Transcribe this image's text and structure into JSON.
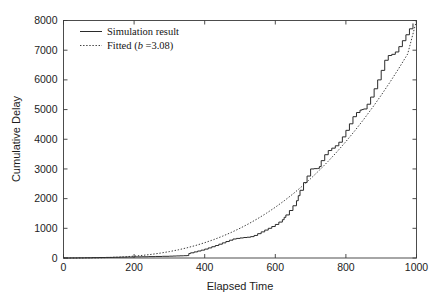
{
  "chart_data": {
    "type": "line",
    "title": "",
    "xlabel": "Elapsed Time",
    "ylabel": "Cumulative Delay",
    "xlim": [
      0,
      1000
    ],
    "ylim": [
      0,
      8000
    ],
    "xticks": [
      0,
      200,
      400,
      600,
      800,
      1000
    ],
    "yticks": [
      0,
      1000,
      2000,
      3000,
      4000,
      5000,
      6000,
      7000,
      8000
    ],
    "xtick_labels": [
      "0",
      "200",
      "400",
      "600",
      "800",
      "1000"
    ],
    "ytick_labels": [
      "0",
      "1000",
      "2000",
      "3000",
      "4000",
      "5000",
      "6000",
      "7000",
      "8000"
    ],
    "grid": false,
    "legend_position": "upper-left-inside",
    "legend_frame": false,
    "series": [
      {
        "name": "Simulation result",
        "label": "Simulation result",
        "style": "solid",
        "color": "#2b2b2b",
        "shape": "step",
        "x": [
          0,
          20,
          40,
          60,
          80,
          100,
          120,
          140,
          160,
          180,
          200,
          220,
          240,
          260,
          280,
          300,
          310,
          320,
          330,
          340,
          350,
          355,
          360,
          370,
          380,
          390,
          400,
          410,
          420,
          430,
          440,
          450,
          460,
          470,
          480,
          490,
          500,
          510,
          520,
          530,
          540,
          550,
          560,
          570,
          580,
          590,
          600,
          610,
          620,
          625,
          630,
          640,
          650,
          660,
          665,
          670,
          680,
          690,
          700,
          710,
          720,
          725,
          730,
          740,
          750,
          760,
          770,
          780,
          790,
          800,
          810,
          820,
          830,
          840,
          845,
          850,
          860,
          870,
          880,
          890,
          900,
          910,
          920,
          930,
          940,
          950,
          960,
          970,
          980,
          990
        ],
        "y": [
          0,
          2,
          5,
          8,
          12,
          16,
          20,
          24,
          28,
          33,
          38,
          42,
          47,
          52,
          57,
          62,
          66,
          70,
          74,
          78,
          82,
          150,
          175,
          205,
          235,
          265,
          300,
          340,
          380,
          420,
          465,
          510,
          555,
          600,
          640,
          660,
          675,
          690,
          700,
          720,
          760,
          820,
          880,
          940,
          1000,
          1060,
          1130,
          1210,
          1290,
          1370,
          1450,
          1600,
          1760,
          1930,
          2100,
          2280,
          2540,
          2760,
          3000,
          3010,
          3020,
          3080,
          3280,
          3480,
          3620,
          3700,
          3780,
          3900,
          4080,
          4300,
          4520,
          4760,
          4900,
          4980,
          5000,
          5020,
          5180,
          5420,
          5700,
          6000,
          6320,
          6660,
          6820,
          6860,
          6940,
          7120,
          7320,
          7520,
          7720,
          7900
        ]
      },
      {
        "name": "Fitted (b =3.08)",
        "label_prefix": "Fitted (",
        "label_param": "b",
        "label_suffix": " =3.08)",
        "style": "dotted",
        "color": "#3c3c3c",
        "shape": "smooth",
        "model": "power",
        "b": 3.08,
        "x": [
          0,
          25,
          50,
          75,
          100,
          125,
          150,
          175,
          200,
          225,
          250,
          275,
          300,
          325,
          350,
          375,
          400,
          425,
          450,
          475,
          500,
          525,
          550,
          575,
          600,
          625,
          650,
          675,
          700,
          725,
          750,
          775,
          800,
          825,
          850,
          875,
          900,
          925,
          950,
          975,
          1000
        ],
        "y": [
          0,
          0.1,
          0.9,
          3.2,
          7.6,
          15,
          26,
          42,
          63,
          90,
          124,
          166,
          216,
          275,
          344,
          424,
          515,
          617,
          732,
          860,
          1001,
          1156,
          1325,
          1509,
          1709,
          1925,
          2157,
          2406,
          2673,
          2957,
          3260,
          3581,
          3922,
          4282,
          4662,
          5062,
          5483,
          5925,
          6389,
          6874,
          8000
        ]
      }
    ]
  },
  "legend": {
    "entries": [
      {
        "label": "Simulation result",
        "style": "solid"
      },
      {
        "label_prefix": "Fitted (",
        "label_param": "b",
        "label_suffix": " =3.08)",
        "style": "dotted"
      }
    ]
  },
  "axes": {
    "x_title": "Elapsed Time",
    "y_title": "Cumulative Delay"
  }
}
